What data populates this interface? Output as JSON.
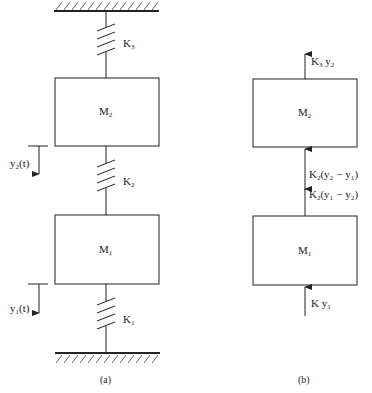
{
  "figure": {
    "panel_a": {
      "caption": "(a)",
      "masses": [
        {
          "id": "M2",
          "label": "M",
          "sub": "2"
        },
        {
          "id": "M1",
          "label": "M",
          "sub": "1"
        }
      ],
      "springs": [
        {
          "id": "K3",
          "label": "K",
          "sub": "3"
        },
        {
          "id": "K2",
          "label": "K",
          "sub": "2"
        },
        {
          "id": "K1",
          "label": "K",
          "sub": "1"
        }
      ],
      "displacements": [
        {
          "id": "y2",
          "label": "y",
          "sub": "2",
          "suffix": "(t)"
        },
        {
          "id": "y1",
          "label": "y",
          "sub": "1",
          "suffix": "(t)"
        }
      ]
    },
    "panel_b": {
      "caption": "(b)",
      "masses": [
        {
          "id": "M2",
          "label": "M",
          "sub": "2"
        },
        {
          "id": "M1",
          "label": "M",
          "sub": "1"
        }
      ],
      "forces": [
        {
          "id": "f_top",
          "k": "K",
          "ksub": "3",
          "expr_pre": " y",
          "expr_sub": "2",
          "expr_post": ""
        },
        {
          "id": "f_m2_bottom",
          "k": "K",
          "ksub": "2",
          "expr": "(y₂ − y₁)"
        },
        {
          "id": "f_m1_top",
          "k": "K",
          "ksub": "2",
          "expr": "(y₁ − y₂)"
        },
        {
          "id": "f_bottom",
          "k": "K",
          "ksub": "",
          "expr_pre": " y",
          "expr_sub": "1",
          "expr_post": ""
        }
      ]
    }
  }
}
